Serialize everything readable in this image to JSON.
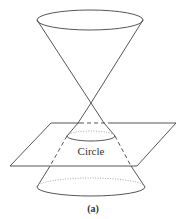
{
  "figure": {
    "caption": "(a)",
    "intersection_label": "Circle",
    "colors": {
      "stroke": "#444444",
      "dotted": "#999999",
      "text": "#333333",
      "background": "#ffffff"
    }
  }
}
